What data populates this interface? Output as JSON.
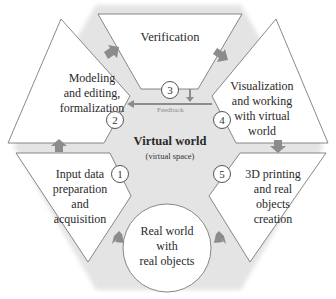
{
  "diagram": {
    "colors": {
      "hexagon_fill": "#e4e4e4",
      "shape_fill": "#ffffff",
      "shape_stroke": "#6b6b6b",
      "arrow": "#8c8c8c",
      "feedback_arrow": "#8c8c8c"
    },
    "center": {
      "title": "Virtual world",
      "subtitle": "(virtual space)"
    },
    "feedback_label": "Feedback",
    "real_world": {
      "label": "Real world\nwith\nreal objects"
    },
    "stages": [
      {
        "number": "1",
        "label": "Input data\npreparation\nand\nacquisition"
      },
      {
        "number": "2",
        "label": "Modeling\nand editing,\nformalization"
      },
      {
        "number": "3",
        "label": "Verification"
      },
      {
        "number": "4",
        "label": "Visualization\nand working\nwith virtual\nworld"
      },
      {
        "number": "5",
        "label": "3D printing\nand real\nobjects\ncreation"
      }
    ]
  }
}
